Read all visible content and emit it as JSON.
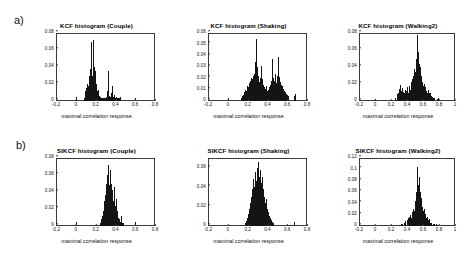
{
  "figure": {
    "panel_labels": {
      "top": "a)",
      "bottom": "b)"
    },
    "xlabel": "maximal correlation response"
  },
  "chart_data": [
    {
      "id": "kcf-couple",
      "type": "bar",
      "title": "KCF histogram (Couple)",
      "xlabel": "maximal correlation response",
      "ylabel": "",
      "xlim": [
        -0.2,
        0.8
      ],
      "ylim": [
        0,
        0.08
      ],
      "xticks": [
        "-0.2",
        "0",
        "0.2",
        "0.4",
        "0.6",
        "0.8"
      ],
      "xtick_values": [
        -0.2,
        0,
        0.2,
        0.4,
        0.6,
        0.8
      ],
      "yticks": [
        "0",
        "0.02",
        "0.04",
        "0.06",
        "0.08"
      ],
      "ytick_values": [
        0,
        0.02,
        0.04,
        0.06,
        0.08
      ],
      "grid": false,
      "bin_width": 0.01,
      "x": [
        0.0,
        0.08,
        0.09,
        0.1,
        0.11,
        0.12,
        0.13,
        0.14,
        0.15,
        0.16,
        0.17,
        0.18,
        0.19,
        0.2,
        0.21,
        0.22,
        0.23,
        0.24,
        0.25,
        0.26,
        0.27,
        0.28,
        0.29,
        0.3,
        0.31,
        0.32,
        0.33,
        0.34,
        0.35,
        0.36,
        0.37,
        0.38,
        0.39,
        0.4,
        0.41,
        0.42,
        0.43,
        0.44,
        0.45,
        0.6
      ],
      "values": [
        0.005,
        0.004,
        0.012,
        0.015,
        0.02,
        0.018,
        0.03,
        0.038,
        0.07,
        0.03,
        0.072,
        0.04,
        0.035,
        0.02,
        0.012,
        0.013,
        0.006,
        0.005,
        0.004,
        0.003,
        0.004,
        0.003,
        0.004,
        0.005,
        0.004,
        0.012,
        0.035,
        0.006,
        0.005,
        0.01,
        0.018,
        0.005,
        0.007,
        0.004,
        0.005,
        0.003,
        0.004,
        0.003,
        0.005,
        0.004
      ]
    },
    {
      "id": "kcf-shaking",
      "type": "bar",
      "title": "KCF histogram (Shaking)",
      "xlabel": "maximal correlation response",
      "ylabel": "",
      "xlim": [
        -0.2,
        0.8
      ],
      "ylim": [
        0,
        0.06
      ],
      "xticks": [
        "-0.2",
        "0",
        "0.2",
        "0.4",
        "0.6",
        "0.8"
      ],
      "xtick_values": [
        -0.2,
        0,
        0.2,
        0.4,
        0.6,
        0.8
      ],
      "yticks": [
        "0",
        "0.01",
        "0.02",
        "0.03",
        "0.04",
        "0.05",
        "0.06"
      ],
      "ytick_values": [
        0,
        0.01,
        0.02,
        0.03,
        0.04,
        0.05,
        0.06
      ],
      "grid": false,
      "bin_width": 0.01,
      "x": [
        0.0,
        0.13,
        0.14,
        0.15,
        0.16,
        0.17,
        0.18,
        0.19,
        0.2,
        0.21,
        0.22,
        0.23,
        0.24,
        0.25,
        0.26,
        0.27,
        0.28,
        0.29,
        0.3,
        0.31,
        0.32,
        0.33,
        0.34,
        0.35,
        0.36,
        0.37,
        0.38,
        0.39,
        0.4,
        0.41,
        0.42,
        0.43,
        0.44,
        0.45,
        0.46,
        0.47,
        0.48,
        0.49,
        0.5,
        0.51,
        0.52,
        0.53,
        0.54,
        0.55,
        0.56,
        0.57,
        0.58,
        0.59,
        0.6,
        0.61,
        0.67,
        0.68
      ],
      "values": [
        0.003,
        0.003,
        0.004,
        0.005,
        0.008,
        0.01,
        0.009,
        0.013,
        0.012,
        0.016,
        0.018,
        0.02,
        0.019,
        0.022,
        0.024,
        0.034,
        0.055,
        0.03,
        0.022,
        0.018,
        0.017,
        0.02,
        0.031,
        0.019,
        0.014,
        0.012,
        0.011,
        0.013,
        0.009,
        0.01,
        0.012,
        0.014,
        0.018,
        0.037,
        0.02,
        0.018,
        0.024,
        0.016,
        0.022,
        0.039,
        0.021,
        0.017,
        0.014,
        0.013,
        0.011,
        0.009,
        0.008,
        0.006,
        0.005,
        0.004,
        0.004,
        0.006
      ]
    },
    {
      "id": "kcf-walking2",
      "type": "bar",
      "title": "KCF histogram (Walking2)",
      "xlabel": "maximal correlation response",
      "ylabel": "",
      "xlim": [
        -0.2,
        1.0
      ],
      "ylim": [
        0,
        0.08
      ],
      "xticks": [
        "-0.2",
        "0",
        "0.2",
        "0.4",
        "0.6",
        "0.8",
        "1"
      ],
      "xtick_values": [
        -0.2,
        0,
        0.2,
        0.4,
        0.6,
        0.8,
        1.0
      ],
      "yticks": [
        "0",
        "0.02",
        "0.04",
        "0.06",
        "0.08"
      ],
      "ytick_values": [
        0,
        0.02,
        0.04,
        0.06,
        0.08
      ],
      "grid": false,
      "bin_width": 0.01,
      "x": [
        0.0,
        0.25,
        0.27,
        0.28,
        0.29,
        0.3,
        0.31,
        0.32,
        0.33,
        0.34,
        0.35,
        0.36,
        0.37,
        0.38,
        0.39,
        0.4,
        0.41,
        0.42,
        0.43,
        0.44,
        0.45,
        0.46,
        0.47,
        0.48,
        0.49,
        0.5,
        0.51,
        0.52,
        0.53,
        0.54,
        0.55,
        0.56,
        0.57,
        0.58,
        0.59,
        0.6,
        0.61,
        0.62,
        0.63,
        0.64,
        0.65,
        0.66,
        0.67,
        0.68,
        0.69,
        0.7,
        0.71,
        0.72,
        0.73,
        0.74,
        0.78,
        0.79
      ],
      "values": [
        0.002,
        0.003,
        0.005,
        0.008,
        0.01,
        0.014,
        0.019,
        0.012,
        0.01,
        0.015,
        0.011,
        0.009,
        0.013,
        0.008,
        0.012,
        0.016,
        0.01,
        0.014,
        0.018,
        0.013,
        0.022,
        0.026,
        0.02,
        0.03,
        0.038,
        0.034,
        0.05,
        0.062,
        0.078,
        0.058,
        0.044,
        0.04,
        0.03,
        0.026,
        0.022,
        0.018,
        0.02,
        0.014,
        0.016,
        0.012,
        0.01,
        0.013,
        0.009,
        0.008,
        0.01,
        0.006,
        0.005,
        0.004,
        0.003,
        0.003,
        0.002,
        0.003
      ]
    },
    {
      "id": "sikcf-couple",
      "type": "bar",
      "title": "SIKCF histogram (Couple)",
      "xlabel": "maximal correlation response",
      "ylabel": "",
      "xlim": [
        -0.2,
        0.8
      ],
      "ylim": [
        0,
        0.08
      ],
      "xticks": [
        "-0.2",
        "0",
        "0.2",
        "0.4",
        "0.6",
        "0.8"
      ],
      "xtick_values": [
        -0.2,
        0,
        0.2,
        0.4,
        0.6,
        0.8
      ],
      "yticks": [
        "0",
        "0.02",
        "0.04",
        "0.06",
        "0.08"
      ],
      "ytick_values": [
        0,
        0.02,
        0.04,
        0.06,
        0.08
      ],
      "grid": false,
      "bin_width": 0.01,
      "x": [
        0.0,
        0.24,
        0.25,
        0.26,
        0.27,
        0.28,
        0.29,
        0.3,
        0.31,
        0.32,
        0.33,
        0.34,
        0.35,
        0.36,
        0.37,
        0.38,
        0.39,
        0.4,
        0.41,
        0.42,
        0.43,
        0.44,
        0.45,
        0.46,
        0.47,
        0.48,
        0.6
      ],
      "values": [
        0.005,
        0.004,
        0.008,
        0.012,
        0.018,
        0.03,
        0.036,
        0.046,
        0.05,
        0.06,
        0.072,
        0.048,
        0.066,
        0.05,
        0.042,
        0.03,
        0.046,
        0.024,
        0.032,
        0.018,
        0.01,
        0.008,
        0.005,
        0.012,
        0.004,
        0.003,
        0.005
      ]
    },
    {
      "id": "sikcf-shaking",
      "type": "bar",
      "title": "SIKCF histogram (Shaking)",
      "xlabel": "maximal correlation response",
      "ylabel": "",
      "xlim": [
        -0.2,
        0.8
      ],
      "ylim": [
        0,
        0.07
      ],
      "xticks": [
        "-0.2",
        "0",
        "0.2",
        "0.4",
        "0.6",
        "0.8"
      ],
      "xtick_values": [
        -0.2,
        0,
        0.2,
        0.4,
        0.6,
        0.8
      ],
      "yticks": [
        "0",
        "0.02",
        "0.04",
        "0.06"
      ],
      "ytick_values": [
        0,
        0.02,
        0.04,
        0.06
      ],
      "grid": false,
      "bin_width": 0.01,
      "x": [
        0.17,
        0.18,
        0.19,
        0.2,
        0.21,
        0.22,
        0.23,
        0.24,
        0.25,
        0.26,
        0.27,
        0.28,
        0.29,
        0.3,
        0.31,
        0.32,
        0.33,
        0.34,
        0.35,
        0.36,
        0.37,
        0.38,
        0.39,
        0.4,
        0.41,
        0.42,
        0.43,
        0.44,
        0.45,
        0.46,
        0.67
      ],
      "values": [
        0.003,
        0.005,
        0.008,
        0.012,
        0.018,
        0.024,
        0.03,
        0.038,
        0.048,
        0.04,
        0.056,
        0.046,
        0.06,
        0.052,
        0.066,
        0.05,
        0.058,
        0.044,
        0.05,
        0.038,
        0.03,
        0.024,
        0.028,
        0.018,
        0.014,
        0.01,
        0.008,
        0.006,
        0.004,
        0.003,
        0.004
      ]
    },
    {
      "id": "sikcf-walking2",
      "type": "bar",
      "title": "SIKCF histogram (Walking2)",
      "xlabel": "maximal correlation response",
      "ylabel": "",
      "xlim": [
        -0.2,
        1.0
      ],
      "ylim": [
        0,
        0.12
      ],
      "xticks": [
        "-0.2",
        "0",
        "0.2",
        "0.4",
        "0.6",
        "0.8",
        "1"
      ],
      "xtick_values": [
        -0.2,
        0,
        0.2,
        0.4,
        0.6,
        0.8,
        1.0
      ],
      "yticks": [
        "0",
        "0.02",
        "0.04",
        "0.06",
        "0.08",
        "0.1",
        "0.12"
      ],
      "ytick_values": [
        0,
        0.02,
        0.04,
        0.06,
        0.08,
        0.1,
        0.12
      ],
      "grid": false,
      "bin_width": 0.01,
      "x": [
        0.3,
        0.32,
        0.34,
        0.36,
        0.38,
        0.4,
        0.41,
        0.42,
        0.43,
        0.44,
        0.45,
        0.46,
        0.47,
        0.48,
        0.49,
        0.5,
        0.51,
        0.52,
        0.53,
        0.54,
        0.55,
        0.56,
        0.57,
        0.58,
        0.59,
        0.6,
        0.61,
        0.62,
        0.63,
        0.64,
        0.65,
        0.66,
        0.67,
        0.68,
        0.69,
        0.7,
        0.72,
        0.74,
        0.76,
        0.78
      ],
      "values": [
        0.002,
        0.003,
        0.004,
        0.005,
        0.008,
        0.01,
        0.014,
        0.012,
        0.016,
        0.02,
        0.015,
        0.024,
        0.018,
        0.03,
        0.026,
        0.044,
        0.06,
        0.08,
        0.104,
        0.072,
        0.086,
        0.06,
        0.05,
        0.04,
        0.034,
        0.026,
        0.03,
        0.022,
        0.018,
        0.014,
        0.016,
        0.01,
        0.012,
        0.008,
        0.006,
        0.005,
        0.004,
        0.003,
        0.003,
        0.002
      ]
    }
  ]
}
